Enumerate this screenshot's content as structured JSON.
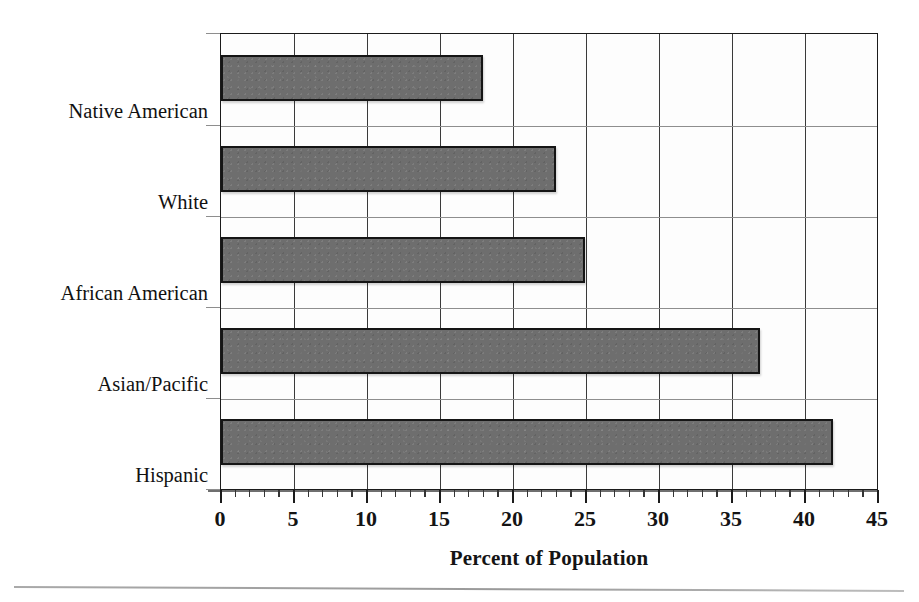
{
  "chart_data": {
    "type": "bar",
    "orientation": "horizontal",
    "title": "",
    "xlabel": "Percent of Population",
    "ylabel": "",
    "categories": [
      "Native American",
      "White",
      "African American",
      "Asian/Pacific",
      "Hispanic"
    ],
    "values": [
      18,
      23,
      25,
      37,
      42
    ],
    "xlim": [
      0,
      45
    ],
    "xticks": [
      0,
      5,
      10,
      15,
      20,
      25,
      30,
      35,
      40,
      45
    ],
    "xtick_labels": [
      "0",
      "5",
      "10",
      "15",
      "20",
      "25",
      "30",
      "35",
      "40",
      "45"
    ],
    "minor_tick_interval": 1,
    "grid": "vertical-major-and-horizontal-category-separators",
    "legend": "none",
    "bar_fill_color": "#6e6e6e",
    "bar_edge_color": "#151515",
    "axis_color": "#1b1b1b",
    "gridline_color": "#3a3a3a",
    "background_color": "#ffffff"
  }
}
